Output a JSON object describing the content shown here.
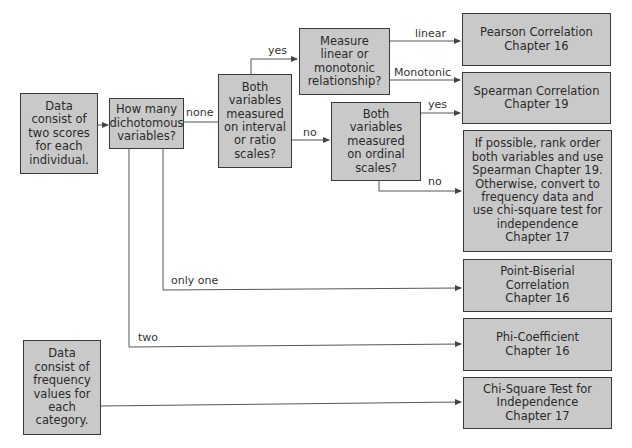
{
  "colors": {
    "box_fill": "#c9c9c9",
    "box_border": "#3a3a3a",
    "line": "#555555",
    "background": "#ffffff"
  },
  "nodes": {
    "start_scores": "Data\nconsist of\ntwo scores\nfor each\nindividual.",
    "how_many_dichotomous": "How many\ndichotomous\nvariables?",
    "interval_ratio": "Both\nvariables\nmeasured\non interval\nor ratio\nscales?",
    "linear_monotonic": "Measure\nlinear or\nmonotonic\nrelationship?",
    "ordinal": "Both\nvariables\nmeasured\non ordinal\nscales?",
    "pearson": "Pearson Correlation\nChapter 16",
    "spearman": "Spearman Correlation\nChapter 19",
    "rank_or_chisquare": "If possible, rank order\nboth variables and use\nSpearman Chapter 19.\nOtherwise, convert to\nfrequency data and\nuse chi-square test for\nindependence\nChapter 17",
    "point_biserial": "Point-Biserial\nCorrelation\nChapter 16",
    "phi": "Phi-Coefficient\nChapter 16",
    "start_frequency": "Data\nconsist of\nfrequency\nvalues for\neach\ncategory.",
    "chi_square": "Chi-Square Test for\nIndependence\nChapter 17"
  },
  "edge_labels": {
    "none": "none",
    "yes_interval": "yes",
    "no_interval": "no",
    "linear": "linear",
    "monotonic": "Monotonic",
    "yes_ordinal": "yes",
    "no_ordinal": "no",
    "only_one": "only one",
    "two": "two"
  }
}
